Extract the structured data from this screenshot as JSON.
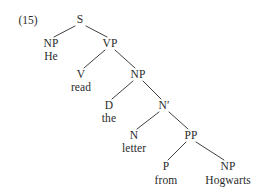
{
  "figure": {
    "example_number": "(15)",
    "sentence": "He read the letter from Hogwarts",
    "ink_color": "#2a2a2a",
    "background_color": "#ffffff"
  },
  "tree": {
    "nodes": [
      {
        "id": "S",
        "label": "S",
        "x": 80,
        "y": 19,
        "kind": "category"
      },
      {
        "id": "NP1",
        "label": "NP",
        "x": 51,
        "y": 43,
        "kind": "category"
      },
      {
        "id": "He",
        "label": "He",
        "x": 51,
        "y": 56,
        "kind": "terminal"
      },
      {
        "id": "VP",
        "label": "VP",
        "x": 110,
        "y": 43,
        "kind": "category"
      },
      {
        "id": "V",
        "label": "V",
        "x": 81,
        "y": 74,
        "kind": "category"
      },
      {
        "id": "read",
        "label": "read",
        "x": 81,
        "y": 87,
        "kind": "terminal"
      },
      {
        "id": "NP2",
        "label": "NP",
        "x": 138,
        "y": 74,
        "kind": "category"
      },
      {
        "id": "D",
        "label": "D",
        "x": 109,
        "y": 105,
        "kind": "category"
      },
      {
        "id": "the",
        "label": "the",
        "x": 109,
        "y": 118,
        "kind": "terminal"
      },
      {
        "id": "Nbar",
        "label": "N′",
        "x": 164,
        "y": 105,
        "kind": "category"
      },
      {
        "id": "N",
        "label": "N",
        "x": 134,
        "y": 135,
        "kind": "category"
      },
      {
        "id": "letter",
        "label": "letter",
        "x": 134,
        "y": 148,
        "kind": "terminal"
      },
      {
        "id": "PP",
        "label": "PP",
        "x": 191,
        "y": 135,
        "kind": "category"
      },
      {
        "id": "P",
        "label": "P",
        "x": 166,
        "y": 166,
        "kind": "category"
      },
      {
        "id": "from",
        "label": "from",
        "x": 166,
        "y": 180,
        "kind": "terminal"
      },
      {
        "id": "NP3",
        "label": "NP",
        "x": 228,
        "y": 166,
        "kind": "category"
      },
      {
        "id": "Hogwarts",
        "label": "Hogwarts",
        "x": 228,
        "y": 180,
        "kind": "terminal"
      }
    ],
    "edges": [
      {
        "from": "S",
        "to": "NP1",
        "x1": 75,
        "y1": 26,
        "x2": 54,
        "y2": 37
      },
      {
        "from": "S",
        "to": "VP",
        "x1": 86,
        "y1": 26,
        "x2": 107,
        "y2": 37
      },
      {
        "from": "VP",
        "to": "V",
        "x1": 105,
        "y1": 50,
        "x2": 84,
        "y2": 68
      },
      {
        "from": "VP",
        "to": "NP2",
        "x1": 115,
        "y1": 50,
        "x2": 135,
        "y2": 68
      },
      {
        "from": "NP2",
        "to": "D",
        "x1": 133,
        "y1": 81,
        "x2": 112,
        "y2": 99
      },
      {
        "from": "NP2",
        "to": "Nbar",
        "x1": 143,
        "y1": 81,
        "x2": 161,
        "y2": 99
      },
      {
        "from": "Nbar",
        "to": "N",
        "x1": 159,
        "y1": 112,
        "x2": 137,
        "y2": 129
      },
      {
        "from": "Nbar",
        "to": "PP",
        "x1": 169,
        "y1": 112,
        "x2": 188,
        "y2": 129
      },
      {
        "from": "PP",
        "to": "P",
        "x1": 186,
        "y1": 142,
        "x2": 168,
        "y2": 160
      },
      {
        "from": "PP",
        "to": "NP3",
        "x1": 196,
        "y1": 142,
        "x2": 224,
        "y2": 160
      }
    ]
  },
  "label_number": {
    "x": 28,
    "y": 20
  }
}
